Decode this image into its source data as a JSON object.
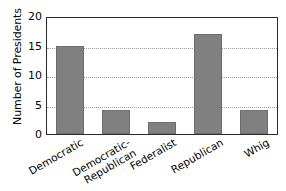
{
  "chart_data": {
    "type": "bar",
    "title": "",
    "xlabel": "",
    "ylabel": "Number of Presidents",
    "categories": [
      "Democratic",
      "Democratic-\nRepublican",
      "Federalist",
      "Republican",
      "Whig"
    ],
    "values": [
      15,
      4,
      2,
      17,
      4
    ],
    "ylim": [
      0,
      20
    ],
    "yticks": [
      20,
      15,
      10,
      5,
      0
    ],
    "ytick_labels": [
      "20",
      "15",
      "10",
      "5",
      "0"
    ],
    "grid": true,
    "legend": false,
    "bar_color": "#808080",
    "axis_color": "#2b2b2b",
    "gridline_color": "#9a9a9a",
    "background": "#ffffff"
  }
}
